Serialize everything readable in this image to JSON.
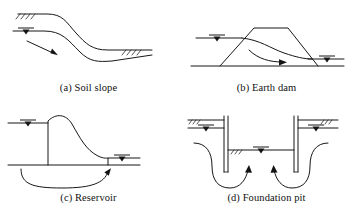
{
  "figure": {
    "background_color": "#ffffff",
    "line_color": "#171717",
    "panel_count": 4
  },
  "panels": [
    {
      "id": "a",
      "caption": "(a) Soil slope",
      "subject": "soil-slope",
      "elements": [
        "ground-surface-curve",
        "phreatic-line-curve",
        "water-table-symbol",
        "seepage-flow-arrow",
        "ground-hatching-upper-left",
        "ground-hatching-lower-right"
      ]
    },
    {
      "id": "b",
      "caption": "(b) Earth dam",
      "subject": "earth-dam",
      "elements": [
        "ground-line",
        "dam-trapezoid-body",
        "upstream-water-level",
        "downstream-water-level",
        "phreatic-seepage-line",
        "seepage-flow-arrow",
        "water-table-symbol-upstream",
        "water-table-symbol-downstream"
      ]
    },
    {
      "id": "c",
      "caption": "(c) Reservoir",
      "subject": "reservoir",
      "elements": [
        "ground-line",
        "gravity-dam-profile",
        "upstream-water-level",
        "downstream-water-level",
        "under-seepage-arc",
        "seepage-flow-arrow",
        "water-table-symbol-upstream",
        "water-table-symbol-downstream"
      ]
    },
    {
      "id": "d",
      "caption": "(d) Foundation pit",
      "subject": "foundation-pit",
      "elements": [
        "ground-line-left",
        "ground-line-right",
        "sheet-pile-wall-left",
        "sheet-pile-wall-right",
        "excavation-base-line",
        "water-table-symbol-left",
        "water-table-symbol-right",
        "water-table-symbol-pit",
        "seepage-flow-path-left",
        "seepage-flow-path-right",
        "ground-hatching-left",
        "ground-hatching-right",
        "ground-hatching-pit"
      ]
    }
  ]
}
